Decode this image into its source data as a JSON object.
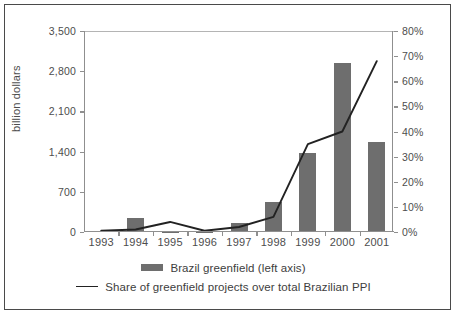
{
  "chart_data": {
    "type": "bar",
    "title": "",
    "xlabel": "",
    "ylabel": "billion dollars",
    "y2label": "",
    "categories": [
      "1993",
      "1994",
      "1995",
      "1996",
      "1997",
      "1998",
      "1999",
      "2000",
      "2001"
    ],
    "ylim": [
      0,
      3500
    ],
    "y2lim": [
      0,
      80
    ],
    "yticks": [
      "0",
      "700",
      "1,400",
      "2,100",
      "2,800",
      "3,500"
    ],
    "ytick_values": [
      0,
      700,
      1400,
      2100,
      2800,
      3500
    ],
    "y2ticks": [
      "0%",
      "10%",
      "20%",
      "30%",
      "40%",
      "50%",
      "60%",
      "70%",
      "80%"
    ],
    "y2tick_values": [
      0,
      10,
      20,
      30,
      40,
      50,
      60,
      70,
      80
    ],
    "grid": false,
    "legend_position": "bottom",
    "series": [
      {
        "name": "Brazil greenfield (left axis)",
        "type": "bar",
        "axis": "left",
        "color": "#6e6e6e",
        "values": [
          10,
          250,
          5,
          5,
          160,
          520,
          1380,
          2950,
          1560
        ]
      },
      {
        "name": "Share of greenfield projects over total Brazilian PPI",
        "type": "line",
        "axis": "right",
        "color": "#222222",
        "values": [
          0.5,
          1.0,
          4.0,
          0.5,
          2.0,
          6.0,
          35.0,
          40.0,
          68.0
        ]
      }
    ]
  },
  "legend": {
    "items": [
      {
        "label": "Brazil greenfield (left axis)",
        "marker": "bar-swatch"
      },
      {
        "label": "Share of greenfield projects over total Brazilian PPI",
        "marker": "line-swatch"
      }
    ]
  }
}
